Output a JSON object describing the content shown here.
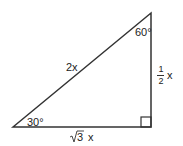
{
  "diagram": {
    "type": "right-triangle",
    "angles": {
      "top": "60°",
      "bottom_left": "30°",
      "bottom_right": "right-angle"
    },
    "sides": {
      "hypotenuse": "2x",
      "vertical_leg": {
        "numerator": "1",
        "denominator": "2",
        "variable": "x"
      },
      "horizontal_leg": {
        "radical": "√",
        "radicand": "3",
        "variable": "x"
      }
    },
    "colors": {
      "stroke": "#333333",
      "background": "#ffffff",
      "text": "#222222"
    }
  }
}
